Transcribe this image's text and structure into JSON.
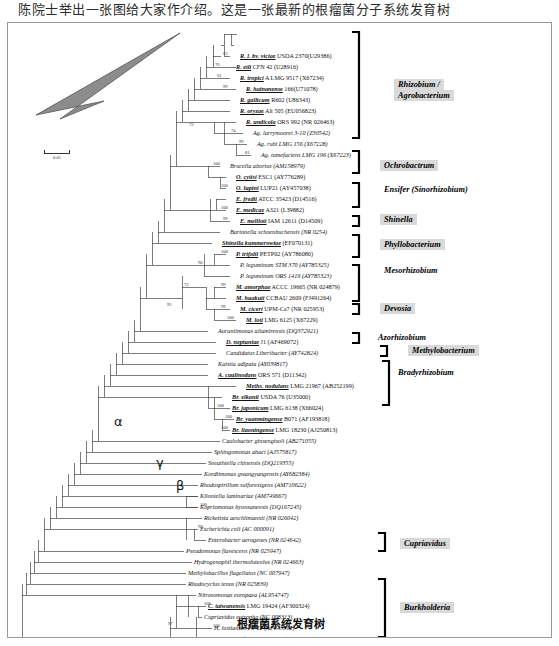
{
  "page": {
    "top_text": "陈院士举出一张图给大家作介绍。这是一张最新的根瘤菌分子系统发育树",
    "caption": "根瘤菌系统发育树"
  },
  "scale_bar": {
    "label": "0.01"
  },
  "greek_markers": [
    {
      "symbol": "α",
      "x": 106,
      "y": 399
    },
    {
      "symbol": "γ",
      "x": 148,
      "y": 440
    },
    {
      "symbol": "β",
      "x": 168,
      "y": 463
    }
  ],
  "group_labels": [
    {
      "text": "Rhizobium /",
      "x": 386,
      "y": 62,
      "shaded": true
    },
    {
      "text": "Agrobacterium",
      "x": 386,
      "y": 73,
      "shaded": true
    },
    {
      "text": "Ochrobactrum",
      "x": 372,
      "y": 143,
      "shaded": true
    },
    {
      "text": "Ensifer (Sinorhizobium)",
      "x": 372,
      "y": 167,
      "shaded": false
    },
    {
      "text": "Shinella",
      "x": 372,
      "y": 197,
      "shaded": true
    },
    {
      "text": "Phyllobacterium",
      "x": 372,
      "y": 222,
      "shaded": true
    },
    {
      "text": "Mesorhizobium",
      "x": 372,
      "y": 248,
      "shaded": false
    },
    {
      "text": "Devosia",
      "x": 372,
      "y": 286,
      "shaded": true
    },
    {
      "text": "Azorhizobium",
      "x": 366,
      "y": 315,
      "shaded": false
    },
    {
      "text": "Methylobacterium",
      "x": 400,
      "y": 328,
      "shaded": true
    },
    {
      "text": "Bradyrhizobium",
      "x": 386,
      "y": 350,
      "shaded": false
    },
    {
      "text": "Cupriavidus",
      "x": 392,
      "y": 521,
      "shaded": true
    },
    {
      "text": "Burkholderia",
      "x": 392,
      "y": 585,
      "shaded": true
    }
  ],
  "taxa": [
    {
      "name": "R. l. bv. viciae",
      "rest": " USDA 2370(U29386)",
      "bold": true,
      "x": 232,
      "y": 33
    },
    {
      "name": "R. etli",
      "rest": " CFN 42 (U28916)",
      "bold": true,
      "x": 228,
      "y": 44
    },
    {
      "name": "R. tropici",
      "rest": " A LMG 9517 (X67234)",
      "bold": true,
      "x": 232,
      "y": 55
    },
    {
      "name": "R. hainanense",
      "rest": " 166(U71078)",
      "bold": true,
      "x": 238,
      "y": 66
    },
    {
      "name": "R. gallicum",
      "rest": " R602 (U86343)",
      "bold": true,
      "x": 232,
      "y": 77
    },
    {
      "name": "R. oryzae",
      "rest": " Alt 505 (EU056823)",
      "bold": true,
      "x": 232,
      "y": 88
    },
    {
      "name": "R. undicola",
      "rest": " ORS 992 (NR 026463)",
      "bold": true,
      "x": 238,
      "y": 99
    },
    {
      "name": "Ag. larrymoorei",
      "rest": " 3-10 (Z30542)",
      "bold": false,
      "x": 245,
      "y": 110
    },
    {
      "name": "Ag. rubi",
      "rest": " LMG 156 (X67228)",
      "bold": false,
      "x": 249,
      "y": 121
    },
    {
      "name": "Ag. tumefaciens",
      "rest": " LMG 196 (X67223)",
      "bold": false,
      "x": 253,
      "y": 132
    },
    {
      "name": "Brucella abortus",
      "rest": " (AM158979)",
      "bold": false,
      "x": 222,
      "y": 143
    },
    {
      "name": "O. cytisi",
      "rest": " ESC1 (AY776289)",
      "bold": true,
      "x": 228,
      "y": 154
    },
    {
      "name": "O. lupini",
      "rest": " LUP21 (AY457038)",
      "bold": true,
      "x": 228,
      "y": 165
    },
    {
      "name": "E. fredii",
      "rest": " ATCC 35423 (D14516)",
      "bold": true,
      "x": 228,
      "y": 176
    },
    {
      "name": "E. medicae",
      "rest": " A321 (L39882)",
      "bold": true,
      "x": 228,
      "y": 187
    },
    {
      "name": "E. meliloti",
      "rest": " IAM 12611 (D14509)",
      "bold": true,
      "x": 232,
      "y": 198
    },
    {
      "name": "Bartonella schoenbuchensis",
      "rest": " (NR 0254)",
      "bold": false,
      "x": 222,
      "y": 209
    },
    {
      "name": "Shinella kummerowiae",
      "rest": " (EF070131)",
      "bold": true,
      "x": 214,
      "y": 220
    },
    {
      "name": "P. trifolii",
      "rest": " PETP02 (AY786080)",
      "bold": true,
      "x": 228,
      "y": 231
    },
    {
      "name": "P. leguminum",
      "rest": " STM 370 (AY785325)",
      "bold": false,
      "x": 232,
      "y": 242
    },
    {
      "name": "P. leguminum",
      "rest": " ORS 1419 (AY785323)",
      "bold": false,
      "x": 232,
      "y": 253
    },
    {
      "name": "M. amorphae",
      "rest": " ACCC 19665 (NR 024879)",
      "bold": true,
      "x": 228,
      "y": 264
    },
    {
      "name": "M. huakuii",
      "rest": " CCBAU 2609 (FJ491264)",
      "bold": true,
      "x": 228,
      "y": 275
    },
    {
      "name": "M. ciceri",
      "rest": " UPM-Ca7 (NR 025953)",
      "bold": true,
      "x": 232,
      "y": 286
    },
    {
      "name": "M. loti",
      "rest": " LMG 6125 (X67229)",
      "bold": true,
      "x": 238,
      "y": 297
    },
    {
      "name": "Aurantimonas altamirensis",
      "rest": " (DQ372921)",
      "bold": false,
      "x": 210,
      "y": 308
    },
    {
      "name": "D. neptuniae",
      "rest": " J1 (AF469072)",
      "bold": true,
      "x": 218,
      "y": 319
    },
    {
      "name": "Candidatus Liberibacter",
      "rest": " (AY742824)",
      "bold": false,
      "x": 218,
      "y": 330
    },
    {
      "name": "Kaistia adipata",
      "rest": " (AY039817)",
      "bold": false,
      "x": 210,
      "y": 341
    },
    {
      "name": "A. caulinodans",
      "rest": " ORS 571 (D11342)",
      "bold": true,
      "x": 210,
      "y": 352
    },
    {
      "name": "Meths. nodulans",
      "rest": " LMG 21967 (AB252199)",
      "bold": true,
      "x": 238,
      "y": 363
    },
    {
      "name": "Br. elkanii",
      "rest": " USDA 76 (U35000)",
      "bold": true,
      "x": 224,
      "y": 374
    },
    {
      "name": "Br. japonicum",
      "rest": " LMG 6138 (X66024)",
      "bold": true,
      "x": 224,
      "y": 385
    },
    {
      "name": "Br. yuanmingense",
      "rest": " B071 (AF193818)",
      "bold": true,
      "x": 228,
      "y": 396
    },
    {
      "name": "Br. liaoningense",
      "rest": " LMG 18230 (AJ250813)",
      "bold": true,
      "x": 224,
      "y": 407
    },
    {
      "name": "Caulobacter ginsengisoli",
      "rest": " (AB271055)",
      "bold": false,
      "x": 214,
      "y": 418
    },
    {
      "name": "Sphingomonas abaci",
      "rest": " (AJ575817)",
      "bold": false,
      "x": 206,
      "y": 429
    },
    {
      "name": "Sneathiella chinensis",
      "rest": " (DQ219355)",
      "bold": false,
      "x": 200,
      "y": 440
    },
    {
      "name": "Kordiimonas gwangyangensis",
      "rest": " (AY682384)",
      "bold": false,
      "x": 196,
      "y": 451
    },
    {
      "name": "Rhodospirillum sulfurexigens",
      "rest": " (AM710622)",
      "bold": false,
      "x": 192,
      "y": 462
    },
    {
      "name": "Kiloniella laminariae",
      "rest": " (AM749667)",
      "bold": false,
      "x": 192,
      "y": 473
    },
    {
      "name": "Kopriomonas byunsanensis",
      "rest": " (DQ167245)",
      "bold": false,
      "x": 192,
      "y": 484
    },
    {
      "name": "Rickettsia aeschlimannii",
      "rest": " (NR 026042)",
      "bold": false,
      "x": 196,
      "y": 495
    },
    {
      "name": "Escherichia coli",
      "rest": " (AC 000091)",
      "bold": false,
      "x": 192,
      "y": 506
    },
    {
      "name": "Enterobacter aerogenes",
      "rest": " (NR 024642)",
      "bold": false,
      "x": 200,
      "y": 517
    },
    {
      "name": "Pseudomonas flavescens",
      "rest": " (NR 025947)",
      "bold": false,
      "x": 178,
      "y": 528
    },
    {
      "name": "Hydrogenophil thermoluteolus",
      "rest": " (NR 024663)",
      "bold": false,
      "x": 186,
      "y": 539
    },
    {
      "name": "Methylobacillus flagellatus",
      "rest": " (NC 007947)",
      "bold": false,
      "x": 180,
      "y": 550
    },
    {
      "name": "Rhodocyclus tenus",
      "rest": " (NR 025839)",
      "bold": false,
      "x": 180,
      "y": 561
    },
    {
      "name": "Nitrosomonas europaea",
      "rest": " (AL954747)",
      "bold": false,
      "x": 190,
      "y": 572
    },
    {
      "name": "C. taiwanensis",
      "rest": " LMG 19424 (AF300324)",
      "bold": true,
      "x": 200,
      "y": 583
    },
    {
      "name": "Cupriavidus eutropha",
      "rest": " (NC 008313)",
      "bold": false,
      "x": 196,
      "y": 594
    },
    {
      "name": "H. lusitanum",
      "rest": " P6-12 (AF543312)",
      "bold": false,
      "x": 206,
      "y": 605
    },
    {
      "name": "Oxalicb. faecigallinarum",
      "rest": " (AB469788)",
      "bold": false,
      "x": 212,
      "y": 616
    },
    {
      "name": "B. mimosarum",
      "rest": " PAS44 (AY752958)",
      "bold": true,
      "x": 214,
      "y": 627
    },
    {
      "name": "B. nodosa",
      "rest": " Br3437 (AY773189)",
      "bold": true,
      "x": 218,
      "y": 638
    },
    {
      "name": "B. tuberum",
      "rest": " STM678 (AJ302311)",
      "bold": true,
      "x": 218,
      "y": 649
    },
    {
      "name": "B. phymatum",
      "rest": " STM815 (AJ302312)",
      "bold": true,
      "x": 214,
      "y": 660
    },
    {
      "name": "B. caribensis",
      "rest": " LMG 18531 (NR 0264)",
      "bold": true,
      "x": 218,
      "y": 671
    },
    {
      "name": "B. sabiae",
      "rest": " Br3407 (AY773186)",
      "bold": true,
      "x": 218,
      "y": 682
    }
  ],
  "bootstrap_values": [
    {
      "v": "63",
      "x": 215,
      "y": 31
    },
    {
      "v": "76",
      "x": 207,
      "y": 42
    },
    {
      "v": "61",
      "x": 209,
      "y": 53
    },
    {
      "v": "99",
      "x": 215,
      "y": 64
    },
    {
      "v": "72",
      "x": 181,
      "y": 102
    },
    {
      "v": "74",
      "x": 223,
      "y": 108
    },
    {
      "v": "99",
      "x": 231,
      "y": 119
    },
    {
      "v": "81",
      "x": 237,
      "y": 130
    },
    {
      "v": "100",
      "x": 205,
      "y": 141
    },
    {
      "v": "100",
      "x": 213,
      "y": 163
    },
    {
      "v": "100",
      "x": 213,
      "y": 185
    },
    {
      "v": "99",
      "x": 215,
      "y": 196
    },
    {
      "v": "100",
      "x": 213,
      "y": 229
    },
    {
      "v": "90",
      "x": 190,
      "y": 240
    },
    {
      "v": "72",
      "x": 176,
      "y": 262
    },
    {
      "v": "99",
      "x": 213,
      "y": 262
    },
    {
      "v": "99",
      "x": 213,
      "y": 284
    },
    {
      "v": "100",
      "x": 219,
      "y": 295
    },
    {
      "v": "95",
      "x": 159,
      "y": 282
    },
    {
      "v": "100",
      "x": 209,
      "y": 383
    },
    {
      "v": "100",
      "x": 217,
      "y": 394
    },
    {
      "v": "100",
      "x": 213,
      "y": 405
    },
    {
      "v": "100",
      "x": 192,
      "y": 482
    },
    {
      "v": "99",
      "x": 190,
      "y": 504
    },
    {
      "v": "100",
      "x": 196,
      "y": 581
    },
    {
      "v": "97",
      "x": 160,
      "y": 601
    },
    {
      "v": "100",
      "x": 205,
      "y": 603
    },
    {
      "v": "94",
      "x": 172,
      "y": 625
    },
    {
      "v": "99",
      "x": 196,
      "y": 625
    },
    {
      "v": "100",
      "x": 190,
      "y": 647
    },
    {
      "v": "100",
      "x": 196,
      "y": 647
    },
    {
      "v": "65",
      "x": 192,
      "y": 658
    },
    {
      "v": "80",
      "x": 192,
      "y": 669
    },
    {
      "v": "77",
      "x": 196,
      "y": 680
    }
  ],
  "chart_data": {
    "type": "tree",
    "title": "根瘤菌系统发育树",
    "scale": "0.01",
    "clades": [
      "alpha",
      "beta",
      "gamma"
    ],
    "genera": [
      "Rhizobium / Agrobacterium",
      "Ochrobactrum",
      "Ensifer (Sinorhizobium)",
      "Shinella",
      "Phyllobacterium",
      "Mesorhizobium",
      "Devosia",
      "Azorhizobium",
      "Methylobacterium",
      "Bradyrhizobium",
      "Cupriavidus",
      "Burkholderia"
    ],
    "n_taxa": 60
  }
}
